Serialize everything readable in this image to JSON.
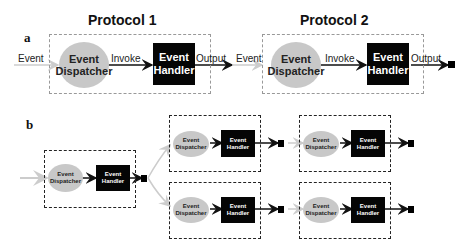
{
  "panel_a": {
    "label": "a",
    "protocols": [
      {
        "title": "Protocol 1",
        "input_label": "Event",
        "dispatcher": "Event Dispatcher",
        "call_label": "Invoke",
        "handler": "Event Handler",
        "output_label": "Output"
      },
      {
        "title": "Protocol 2",
        "input_label": "Event",
        "dispatcher": "Event Dispatcher",
        "call_label": "Invoke",
        "handler": "Event Handler",
        "output_label": "Output"
      }
    ]
  },
  "panel_b": {
    "label": "b",
    "root": {
      "dispatcher": "Event Dispatcher",
      "handler": "Event Handler"
    },
    "branches": [
      {
        "stages": [
          {
            "dispatcher": "Event Dispatcher",
            "handler": "Event Handler"
          },
          {
            "dispatcher": "Event Dispatcher",
            "handler": "Event Handler"
          }
        ]
      },
      {
        "stages": [
          {
            "dispatcher": "Event Dispatcher",
            "handler": "Event Handler"
          },
          {
            "dispatcher": "Event Dispatcher",
            "handler": "Event Handler"
          }
        ]
      }
    ]
  },
  "colors": {
    "dispatcher_fill": "#c8c8c8",
    "handler_fill": "#050505",
    "arrow": "#111111",
    "input_arrow": "#cccccc"
  }
}
